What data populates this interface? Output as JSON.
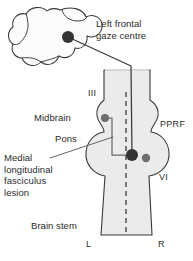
{
  "figure": {
    "type": "anatomical-diagram"
  },
  "labels": {
    "gaze_centre": "Left frontal\ngaze centre",
    "midbrain": "Midbrain",
    "pons": "Pons",
    "mlf_lesion": "Medial\nlongitudinal\nfasciculus\nlesion",
    "brain_stem": "Brain stem",
    "nerve_three": "III",
    "pprf": "PPRF",
    "nerve_six": "VI",
    "side_left": "L",
    "side_right": "R"
  },
  "colors": {
    "text": "#2b2b2b",
    "outline": "#3a3a3a",
    "fill_stem": "#ebebeb",
    "fill_cortex": "#fbfbfb",
    "node_dark": "#333333",
    "node_mid": "#6e6e6e",
    "leader": "#555555",
    "midline_dash": "#5a5a5a"
  },
  "nodes": [
    {
      "name": "frontal-gaze-centre-node",
      "x": 68,
      "y": 37,
      "r": 6.0,
      "shade": "dark"
    },
    {
      "name": "oculomotor-nucleus-node",
      "x": 105,
      "y": 118,
      "r": 4.0,
      "shade": "mid"
    },
    {
      "name": "pprf-lesion-node",
      "x": 132,
      "y": 155,
      "r": 6.0,
      "shade": "dark"
    },
    {
      "name": "abducens-nucleus-node",
      "x": 146,
      "y": 158,
      "r": 4.2,
      "shade": "mid"
    }
  ],
  "midline": {
    "x": 126,
    "y_top": 92,
    "y_bottom": 235,
    "style": "dashed"
  }
}
